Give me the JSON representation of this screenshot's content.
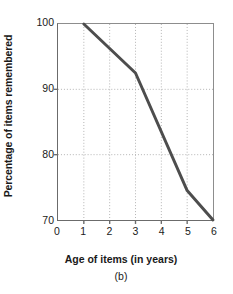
{
  "chart_data": {
    "type": "line",
    "title": "",
    "subtitle": "(b)",
    "xlabel": "Age of items (in years)",
    "ylabel": "Percentage of items remembered",
    "x": [
      1,
      3,
      5,
      6
    ],
    "values": [
      100,
      92.5,
      74.5,
      70
    ],
    "series": [
      {
        "name": "Percentage of items remembered",
        "points": [
          {
            "x": 1,
            "y": 100
          },
          {
            "x": 3,
            "y": 92.5
          },
          {
            "x": 5,
            "y": 74.5
          },
          {
            "x": 6,
            "y": 70
          }
        ]
      }
    ],
    "xlim": [
      0,
      6
    ],
    "ylim": [
      70,
      100
    ],
    "xticks": [
      "0",
      "1",
      "2",
      "3",
      "4",
      "5",
      "6"
    ],
    "yticks": [
      "70",
      "80",
      "90",
      "100"
    ],
    "xtick_values": [
      0,
      1,
      2,
      3,
      4,
      5,
      6
    ],
    "ytick_values": [
      70,
      80,
      90,
      100
    ],
    "grid": true,
    "grid_style": "dotted",
    "legend": false,
    "line_color": "#4d4d4d",
    "grid_color": "#aaaaaa",
    "axis_color": "#6b6b6b",
    "background_color": "#ffffff"
  }
}
